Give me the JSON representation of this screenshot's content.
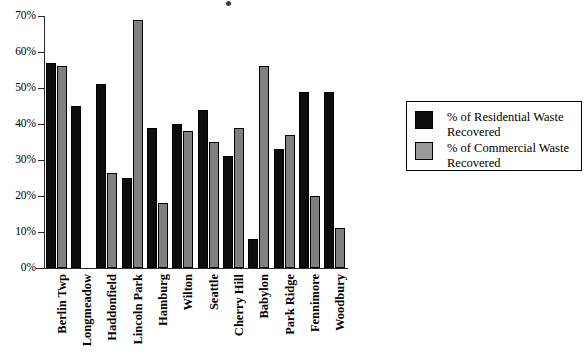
{
  "chart_data": {
    "type": "bar",
    "title": "",
    "subtitle": "",
    "xlabel": "",
    "ylabel": "",
    "ylim": [
      0,
      70
    ],
    "y_ticks": [
      "0%",
      "10%",
      "20%",
      "30%",
      "40%",
      "50%",
      "60%",
      "70%"
    ],
    "y_tick_values": [
      0,
      10,
      20,
      30,
      40,
      50,
      60,
      70
    ],
    "grid": false,
    "legend_position": "right",
    "categories": [
      "Berlin Twp",
      "Longmeadow",
      "Haddonfield",
      "Lincoln Park",
      "Hamburg",
      "Wilton",
      "Seattle",
      "Cherry Hill",
      "Babylon",
      "Park Ridge",
      "Fennimore",
      "Woodbury"
    ],
    "series": [
      {
        "name": "% of Residential Waste Recovered",
        "color": "#0d0d0d",
        "values": [
          57,
          45,
          51,
          25,
          39,
          40,
          44,
          31,
          8,
          33,
          49,
          49
        ]
      },
      {
        "name": "% of Commercial Waste Recovered",
        "color": "#808080",
        "values": [
          56,
          null,
          26.5,
          69,
          18,
          38,
          35,
          39,
          56,
          37,
          20,
          11
        ]
      }
    ],
    "annotations": []
  },
  "legend": {
    "entries": [
      {
        "label": "% of Residential Waste Recovered",
        "swatch": "black-square-swatch"
      },
      {
        "label": "% of Commercial Waste Recovered",
        "swatch": "gray-square-swatch"
      }
    ]
  }
}
